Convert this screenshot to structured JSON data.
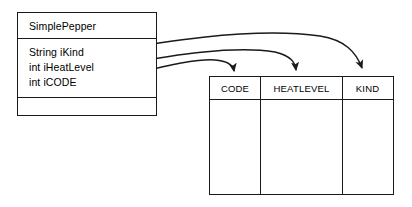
{
  "diagram": {
    "type": "uml-class-to-table-mapping",
    "stroke_color": "#1a1a1a",
    "background_color": "#ffffff"
  },
  "class_box": {
    "name": "SimplePepper",
    "attributes": [
      {
        "label": "String iKind"
      },
      {
        "label": "int iHeatLevel"
      },
      {
        "label": "int iCODE"
      }
    ],
    "operations": []
  },
  "db_table": {
    "columns": [
      {
        "name": "CODE"
      },
      {
        "name": "HEATLEVEL"
      },
      {
        "name": "KIND"
      }
    ],
    "rows": [
      {
        "cells": [
          "",
          "",
          ""
        ]
      }
    ]
  },
  "mappings": [
    {
      "from": "String iKind",
      "to": "KIND"
    },
    {
      "from": "int iHeatLevel",
      "to": "HEATLEVEL"
    },
    {
      "from": "int iCODE",
      "to": "CODE"
    }
  ]
}
